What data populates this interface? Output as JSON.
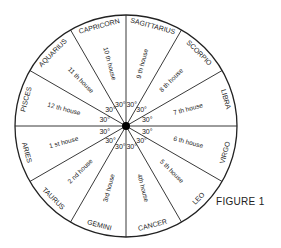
{
  "figure": {
    "caption": "FIGURE 1",
    "center": {
      "x": 126,
      "y": 126
    },
    "radius": 111,
    "line_color": "#222222",
    "sector_angle_label": "30°",
    "sectors": [
      {
        "house": "1 st house",
        "sign": "ARIES",
        "start": 150,
        "end": 180
      },
      {
        "house": "2 nd house",
        "sign": "TAURUS",
        "start": 120,
        "end": 150
      },
      {
        "house": "3rd house",
        "sign": "GEMINI",
        "start": 90,
        "end": 120
      },
      {
        "house": "4th house",
        "sign": "CANCER",
        "start": 60,
        "end": 90
      },
      {
        "house": "5 th house",
        "sign": "LEO",
        "start": 30,
        "end": 60
      },
      {
        "house": "6 th house",
        "sign": "VIRGO",
        "start": 0,
        "end": 30
      },
      {
        "house": "7 th house",
        "sign": "LIBRA",
        "start": -30,
        "end": 0
      },
      {
        "house": "8 th house",
        "sign": "SCORPIO",
        "start": -60,
        "end": -30
      },
      {
        "house": "9 th house",
        "sign": "SAGITTARIUS",
        "start": -90,
        "end": -60
      },
      {
        "house": "10 th house",
        "sign": "CAPRICORN",
        "start": -120,
        "end": -90
      },
      {
        "house": "11 th house",
        "sign": "AQUARIUS",
        "start": -150,
        "end": -120
      },
      {
        "house": "12 th house",
        "sign": "PISCES",
        "start": -180,
        "end": -150
      }
    ]
  }
}
